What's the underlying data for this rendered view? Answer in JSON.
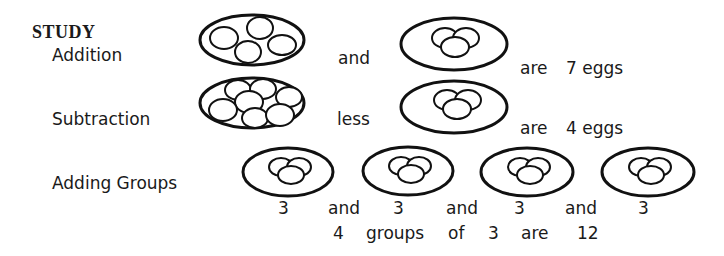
{
  "heading": "STUDY",
  "addition": {
    "label": "Addition",
    "group1_eggs": 4,
    "connector": "and",
    "group2_eggs": 3,
    "verb": "are",
    "result": "7 eggs"
  },
  "subtraction": {
    "label": "Subtraction",
    "group1_eggs": 7,
    "connector": "less",
    "group2_eggs": 3,
    "verb": "are",
    "result": "4 eggs"
  },
  "adding_groups": {
    "label": "Adding Groups",
    "groups": [
      {
        "count": "3"
      },
      {
        "count": "3"
      },
      {
        "count": "3"
      },
      {
        "count": "3"
      }
    ],
    "connectors": [
      "and",
      "and",
      "and"
    ],
    "summary": {
      "groups_count": "4",
      "groups_word": "groups",
      "of_word": "of",
      "group_size": "3",
      "verb": "are",
      "total": "12"
    }
  }
}
